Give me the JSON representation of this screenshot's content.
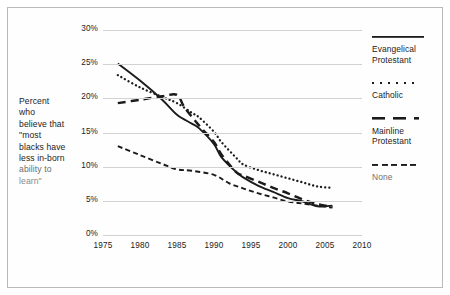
{
  "figure": {
    "background_color": "#ffffff",
    "border_color": "#b9b9b9",
    "ink_color": "#1b1b1b",
    "gridline_color": "#d2d2d2"
  },
  "axis_caption": {
    "lines": [
      "Percent",
      "who",
      "believe that",
      "\"most",
      "blacks have",
      "less in-born",
      "ability to",
      "learn\""
    ]
  },
  "legend": {
    "items": [
      {
        "label_line1": "Evangelical",
        "label_line2": "Protestant",
        "style": "solid",
        "swatch_name": "legend-swatch-solid"
      },
      {
        "label_line1": "Catholic",
        "label_line2": "",
        "style": "dotted",
        "swatch_name": "legend-swatch-dotted"
      },
      {
        "label_line1": "Mainline",
        "label_line2": "Protestant",
        "style": "longdash",
        "swatch_name": "legend-swatch-longdash"
      },
      {
        "label_line1": "None",
        "label_line2": "",
        "style": "dashed",
        "swatch_name": "legend-swatch-dashed"
      }
    ]
  },
  "chart_data": {
    "type": "line",
    "title": "",
    "xlabel": "",
    "ylabel": "Percent who believe that \"most blacks have less in-born ability to learn\"",
    "xlim": [
      1975,
      2010
    ],
    "ylim": [
      0,
      30
    ],
    "ytick_labels": [
      "0%",
      "5%",
      "10%",
      "15%",
      "20%",
      "25%",
      "30%"
    ],
    "ytick_values": [
      0,
      5,
      10,
      15,
      20,
      25,
      30
    ],
    "xtick_labels": [
      "1975",
      "1980",
      "1985",
      "1990",
      "1995",
      "2000",
      "2005",
      "2010"
    ],
    "xtick_values": [
      1975,
      1980,
      1985,
      1990,
      1995,
      2000,
      2005,
      2010
    ],
    "grid": "horizontal",
    "legend_position": "right",
    "y_unit": "percent",
    "series": [
      {
        "name": "Evangelical Protestant",
        "style": "solid",
        "x": [
          1977,
          1980,
          1983,
          1985,
          1987,
          1988,
          1990,
          1991,
          1993,
          1994,
          1996,
          1998,
          2000,
          2002,
          2004,
          2006
        ],
        "values": [
          25.1,
          22.6,
          19.8,
          17.6,
          16.3,
          15.6,
          13.3,
          11.4,
          9.2,
          8.4,
          7.2,
          6.3,
          5.4,
          4.9,
          4.2,
          4.3
        ]
      },
      {
        "name": "Catholic",
        "style": "dotted",
        "x": [
          1977,
          1980,
          1983,
          1985,
          1987,
          1988,
          1990,
          1991,
          1993,
          1994,
          1996,
          1998,
          2000,
          2002,
          2004,
          2006
        ],
        "values": [
          23.4,
          21.6,
          20.2,
          19.3,
          17.9,
          17.2,
          15.1,
          13.6,
          11.3,
          10.3,
          9.5,
          8.9,
          8.3,
          7.7,
          7.1,
          6.9
        ]
      },
      {
        "name": "Mainline Protestant",
        "style": "longdash",
        "x": [
          1977,
          1980,
          1983,
          1985,
          1986,
          1988,
          1990,
          1991,
          1993,
          1994,
          1996,
          1998,
          2000,
          2002,
          2004,
          2006
        ],
        "values": [
          19.3,
          19.8,
          20.3,
          20.5,
          18.7,
          16.0,
          13.6,
          11.8,
          9.2,
          8.7,
          7.8,
          6.9,
          6.1,
          5.2,
          4.5,
          4.1
        ]
      },
      {
        "name": "None",
        "style": "dashed",
        "x": [
          1977,
          1980,
          1983,
          1985,
          1987,
          1990,
          1992,
          1994,
          1996,
          1998,
          2000,
          2002,
          2004,
          2006
        ],
        "values": [
          13.0,
          11.7,
          10.4,
          9.6,
          9.4,
          8.8,
          7.6,
          6.8,
          6.1,
          5.5,
          4.9,
          4.6,
          4.3,
          4.0
        ]
      }
    ]
  }
}
